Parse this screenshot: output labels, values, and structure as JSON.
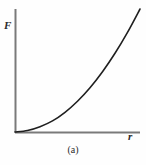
{
  "figure": {
    "caption": "(a)",
    "background_color": "#fefefe",
    "axis_color": "#7a7a7a",
    "curve_color": "#1f1f1f",
    "label_color": "#2b2b2b"
  },
  "chart_data": {
    "type": "line",
    "title": "",
    "subtitle": "",
    "caption": "(a)",
    "xlabel": "r",
    "ylabel": "F",
    "xticklabels": [],
    "yticklabels": [],
    "grid": false,
    "legend": null,
    "annotations": [],
    "axis_origin_px": [
      15,
      132
    ],
    "xaxis_extent_px": [
      15,
      140
    ],
    "yaxis_extent_px": [
      132,
      9
    ],
    "xlim": [
      0,
      1
    ],
    "ylim": [
      0,
      1
    ],
    "series": [
      {
        "name": "F(r)",
        "description": "monotonically increasing convex curve rising from the origin",
        "x": [
          0.0,
          0.1,
          0.2,
          0.3,
          0.4,
          0.5,
          0.6,
          0.7,
          0.8,
          0.9,
          1.0
        ],
        "y": [
          0.0,
          0.012,
          0.043,
          0.09,
          0.16,
          0.25,
          0.36,
          0.49,
          0.64,
          0.81,
          1.0
        ]
      }
    ]
  }
}
